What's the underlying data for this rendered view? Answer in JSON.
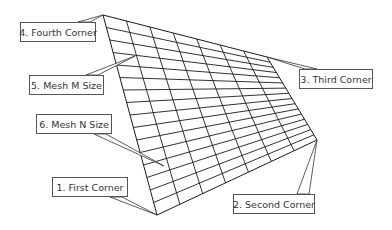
{
  "diagram": {
    "type": "mesh-callout-diagram",
    "mesh": {
      "corners": {
        "first": [
          157,
          215
        ],
        "second": [
          317,
          140
        ],
        "third": [
          267,
          57
        ],
        "fourth": [
          103,
          15
        ]
      },
      "columns": 7,
      "rows": 16,
      "line_color": "#1a1a1a"
    },
    "labels": [
      {
        "id": "fourth-corner",
        "text": "4. Fourth Corner",
        "box": [
          20,
          22,
          76,
          20
        ],
        "target": [
          103,
          15
        ]
      },
      {
        "id": "mesh-m-size",
        "text": "5. Mesh M Size",
        "box": [
          29,
          75,
          75,
          20
        ],
        "target": [
          135,
          56
        ]
      },
      {
        "id": "mesh-n-size",
        "text": "6. Mesh N Size",
        "box": [
          36,
          114,
          76,
          20
        ],
        "target": [
          164,
          166
        ]
      },
      {
        "id": "first-corner",
        "text": "1. First Corner",
        "box": [
          52,
          177,
          76,
          20
        ],
        "target": [
          157,
          215
        ]
      },
      {
        "id": "third-corner",
        "text": "3. Third Corner",
        "box": [
          299,
          69,
          74,
          20
        ],
        "target": [
          267,
          57
        ]
      },
      {
        "id": "second-corner",
        "text": "2. Second Corner",
        "box": [
          233,
          194,
          82,
          20
        ],
        "target": [
          317,
          140
        ]
      }
    ]
  }
}
